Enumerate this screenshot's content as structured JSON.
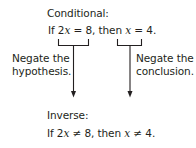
{
  "conditional": {
    "label": "Conditional:",
    "statement": {
      "if_word": "If",
      "hyp_coef": "2",
      "hyp_var": "x",
      "hyp_rel": "= 8,",
      "then_word": "then",
      "conc_var": "x",
      "conc_rel": "= 4."
    }
  },
  "left_annotation": {
    "line1": "Negate the",
    "line2": "hypothesis."
  },
  "right_annotation": {
    "line1": "Negate the",
    "line2": "conclusion."
  },
  "inverse": {
    "label": "Inverse:",
    "statement": {
      "if_word": "If",
      "hyp_coef": "2",
      "hyp_var": "x",
      "hyp_rel": "≠ 8,",
      "then_word": "then",
      "conc_var": "x",
      "conc_rel": "≠ 4."
    }
  },
  "colors": {
    "ink": "#231f20",
    "background": "#ffffff"
  }
}
